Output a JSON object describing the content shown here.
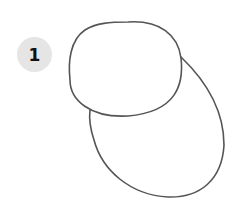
{
  "step": {
    "number": "1"
  },
  "drawing": {
    "description": "Two overlapping ovals: a rounded head shape on top and a larger oval body below-right",
    "stroke_color": "#555555",
    "shapes": [
      "head-oval",
      "body-oval"
    ]
  }
}
